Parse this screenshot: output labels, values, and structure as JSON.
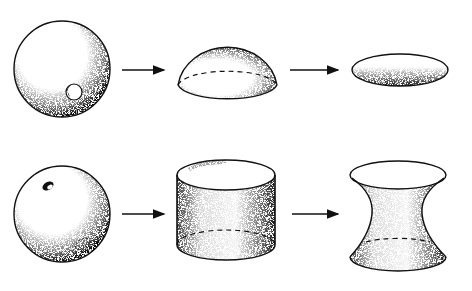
{
  "diagram": {
    "rows": [
      {
        "id": "row-1",
        "stages": [
          {
            "shape": "sphere-with-hole",
            "label": ""
          },
          {
            "shape": "hemisphere",
            "label": ""
          },
          {
            "shape": "disk",
            "label": ""
          }
        ],
        "arrows": 2
      },
      {
        "id": "row-2",
        "stages": [
          {
            "shape": "sphere-with-two-holes",
            "label": ""
          },
          {
            "shape": "cylinder",
            "label": ""
          },
          {
            "shape": "hyperboloid",
            "label": ""
          }
        ],
        "arrows": 2
      }
    ],
    "colors": {
      "stroke": "#111111",
      "background": "#ffffff",
      "shade": "#333333"
    }
  }
}
